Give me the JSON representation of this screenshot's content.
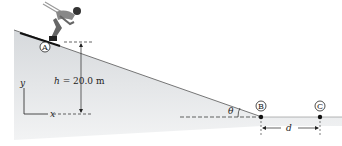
{
  "diagram": {
    "points": {
      "A": "A",
      "B": "B",
      "C": "C"
    },
    "height_label": {
      "var": "h",
      "eq": " = 20.0 m"
    },
    "angle_label": "θ",
    "distance_label": "d",
    "axes": {
      "x": "x",
      "y": "y"
    },
    "colors": {
      "slope_fill": "#dcdfe2",
      "ground_fill": "#e4e6e8",
      "line": "#222222"
    }
  }
}
